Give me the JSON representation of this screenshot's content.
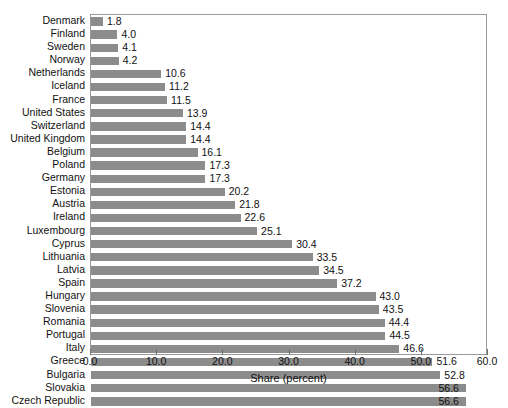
{
  "chart_data": {
    "type": "bar",
    "orientation": "horizontal",
    "title": "",
    "xlabel": "Share (percent)",
    "ylabel": "",
    "xlim": [
      0.0,
      60.0
    ],
    "xticks": [
      "0.0",
      "10.0",
      "20.0",
      "30.0",
      "40.0",
      "50.0",
      "60.0"
    ],
    "xtick_values": [
      0,
      10,
      20,
      30,
      40,
      50,
      60
    ],
    "grid": false,
    "legend": null,
    "bar_color": "#8c8c8c",
    "frame_color": "#9a9a9a",
    "value_label_format": "one-decimal",
    "categories": [
      "Denmark",
      "Finland",
      "Sweden",
      "Norway",
      "Netherlands",
      "Iceland",
      "France",
      "United States",
      "Switzerland",
      "United Kingdom",
      "Belgium",
      "Poland",
      "Germany",
      "Estonia",
      "Austria",
      "Ireland",
      "Luxembourg",
      "Cyprus",
      "Lithuania",
      "Latvia",
      "Spain",
      "Hungary",
      "Slovenia",
      "Romania",
      "Portugal",
      "Italy",
      "Greece",
      "Bulgaria",
      "Slovakia",
      "Czech Republic"
    ],
    "values": [
      1.8,
      4.0,
      4.1,
      4.2,
      10.6,
      11.2,
      11.5,
      13.9,
      14.4,
      14.4,
      16.1,
      17.3,
      17.3,
      20.2,
      21.8,
      22.6,
      25.1,
      30.4,
      33.5,
      34.5,
      37.2,
      43.0,
      43.5,
      44.4,
      44.5,
      46.6,
      51.6,
      52.8,
      56.6,
      56.6
    ],
    "value_labels": [
      "1.8",
      "4.0",
      "4.1",
      "4.2",
      "10.6",
      "11.2",
      "11.5",
      "13.9",
      "14.4",
      "14.4",
      "16.1",
      "17.3",
      "17.3",
      "20.2",
      "21.8",
      "22.6",
      "25.1",
      "30.4",
      "33.5",
      "34.5",
      "37.2",
      "43.0",
      "43.5",
      "44.4",
      "44.5",
      "46.6",
      "51.6",
      "52.8",
      "56.6",
      "56.6"
    ]
  }
}
